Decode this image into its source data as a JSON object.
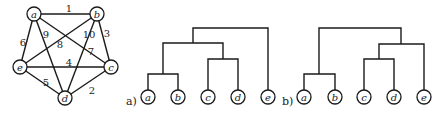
{
  "graph": {
    "nodes": [
      {
        "id": "a",
        "label": "a",
        "x": 34,
        "y": 14
      },
      {
        "id": "b",
        "label": "b",
        "x": 97,
        "y": 14
      },
      {
        "id": "c",
        "label": "c",
        "x": 111,
        "y": 67
      },
      {
        "id": "d",
        "label": "d",
        "x": 65,
        "y": 98
      },
      {
        "id": "e",
        "label": "e",
        "x": 20,
        "y": 67
      }
    ],
    "edges": [
      {
        "from": "a",
        "to": "b",
        "weight": "1",
        "lx": 69,
        "ly": 8
      },
      {
        "from": "d",
        "to": "c",
        "weight": "2",
        "lx": 92,
        "ly": 90
      },
      {
        "from": "b",
        "to": "c",
        "weight": "3",
        "lx": 107,
        "ly": 33
      },
      {
        "from": "e",
        "to": "c",
        "weight": "4",
        "lx": 69,
        "ly": 62
      },
      {
        "from": "e",
        "to": "d",
        "weight": "5",
        "lx": 46,
        "ly": 82
      },
      {
        "from": "a",
        "to": "e",
        "weight": "6",
        "lx": 23,
        "ly": 42
      },
      {
        "from": "a",
        "to": "c",
        "weight": "7",
        "lx": 91,
        "ly": 51
      },
      {
        "from": "b",
        "to": "e",
        "weight": "8",
        "lx": 60,
        "ly": 44
      },
      {
        "from": "a",
        "to": "d",
        "weight": "9",
        "lx": 46,
        "ly": 34
      },
      {
        "from": "b",
        "to": "d",
        "weight": "10",
        "lx": 89,
        "ly": 34
      }
    ],
    "node_radius": 7
  },
  "dendrograms": [
    {
      "panel_label": "a)",
      "label_x": 126,
      "label_y": 101,
      "leaves": [
        {
          "label": "a",
          "x": 148
        },
        {
          "label": "b",
          "x": 178
        },
        {
          "label": "c",
          "x": 208
        },
        {
          "label": "d",
          "x": 238
        },
        {
          "label": "e",
          "x": 268
        }
      ],
      "merges": [
        {
          "left_x": 148,
          "right_x": 178,
          "y": 74,
          "left_top": 90,
          "right_top": 90
        },
        {
          "left_x": 208,
          "right_x": 238,
          "y": 59,
          "left_top": 90,
          "right_top": 90
        },
        {
          "left_x": 163,
          "right_x": 223,
          "y": 43,
          "left_top": 74,
          "right_top": 59
        },
        {
          "left_x": 193,
          "right_x": 268,
          "y": 28,
          "left_top": 43,
          "right_top": 90
        }
      ]
    },
    {
      "panel_label": "b)",
      "label_x": 282,
      "label_y": 101,
      "leaves": [
        {
          "label": "a",
          "x": 304
        },
        {
          "label": "b",
          "x": 335
        },
        {
          "label": "c",
          "x": 364
        },
        {
          "label": "d",
          "x": 394
        },
        {
          "label": "e",
          "x": 424
        }
      ],
      "merges": [
        {
          "left_x": 304,
          "right_x": 335,
          "y": 74,
          "left_top": 90,
          "right_top": 90
        },
        {
          "left_x": 364,
          "right_x": 394,
          "y": 59,
          "left_top": 90,
          "right_top": 90
        },
        {
          "left_x": 379,
          "right_x": 424,
          "y": 44,
          "left_top": 59,
          "right_top": 90
        },
        {
          "left_x": 319,
          "right_x": 401,
          "y": 28,
          "left_top": 74,
          "right_top": 44
        }
      ]
    }
  ],
  "leaf_y": 97,
  "colors": {
    "ink": "#1a1a1a",
    "background": "#ffffff"
  }
}
